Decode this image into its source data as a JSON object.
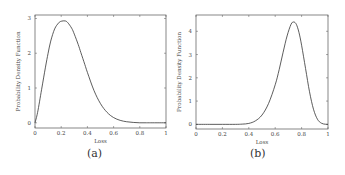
{
  "figure": {
    "captions": [
      "(a)",
      "(b)"
    ]
  },
  "chart_data": [
    {
      "type": "line",
      "title": "",
      "caption": "(a)",
      "xlabel": "Loss",
      "ylabel": "Probability Density Function",
      "xlim": [
        0,
        1
      ],
      "ylim": [
        -0.15,
        3.1
      ],
      "xticks": [
        "0",
        "0.2",
        "0.4",
        "0.6",
        "0.8",
        "1"
      ],
      "yticks": [
        "0",
        "1",
        "2",
        "3"
      ],
      "grid": false,
      "legend": null,
      "series": [
        {
          "name": "PDF",
          "x": [
            0,
            0.02,
            0.05,
            0.08,
            0.1,
            0.12,
            0.15,
            0.18,
            0.2,
            0.23,
            0.25,
            0.28,
            0.3,
            0.33,
            0.35,
            0.38,
            0.4,
            0.45,
            0.5,
            0.55,
            0.6,
            0.65,
            0.7,
            0.75,
            0.8,
            0.85,
            0.9,
            1.0
          ],
          "values": [
            0,
            0.3,
            0.95,
            1.6,
            2.0,
            2.35,
            2.7,
            2.87,
            2.92,
            2.93,
            2.88,
            2.72,
            2.55,
            2.25,
            2.02,
            1.68,
            1.45,
            0.93,
            0.55,
            0.3,
            0.15,
            0.07,
            0.03,
            0.01,
            0.0,
            0.0,
            0.0,
            0.0
          ]
        }
      ]
    },
    {
      "type": "line",
      "title": "",
      "caption": "(b)",
      "xlabel": "Loss",
      "ylabel": "Probability Density Function",
      "xlim": [
        0,
        1
      ],
      "ylim": [
        -0.2,
        4.7
      ],
      "xticks": [
        "0",
        "0.2",
        "0.4",
        "0.6",
        "0.8",
        "1"
      ],
      "yticks": [
        "0",
        "1",
        "2",
        "3",
        "4"
      ],
      "grid": false,
      "legend": null,
      "series": [
        {
          "name": "PDF",
          "x": [
            0,
            0.1,
            0.2,
            0.3,
            0.35,
            0.4,
            0.45,
            0.5,
            0.55,
            0.6,
            0.63,
            0.66,
            0.69,
            0.72,
            0.74,
            0.76,
            0.78,
            0.8,
            0.83,
            0.86,
            0.89,
            0.92,
            0.95,
            0.98,
            1.0
          ],
          "values": [
            0,
            0,
            0,
            0,
            0.01,
            0.04,
            0.15,
            0.4,
            0.9,
            1.7,
            2.35,
            3.1,
            3.8,
            4.3,
            4.4,
            4.3,
            3.95,
            3.4,
            2.4,
            1.4,
            0.65,
            0.22,
            0.05,
            0.005,
            0
          ]
        }
      ]
    }
  ]
}
